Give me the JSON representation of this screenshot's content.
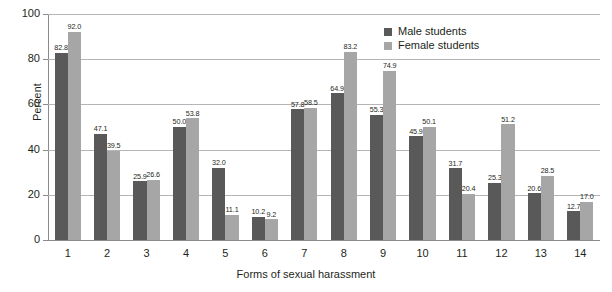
{
  "chart_data": {
    "type": "bar",
    "title": "",
    "subtitle": "",
    "xlabel": "Forms of sexual harassment",
    "ylabel": "Percent",
    "categories": [
      "1",
      "2",
      "3",
      "4",
      "5",
      "6",
      "7",
      "8",
      "9",
      "10",
      "11",
      "12",
      "13",
      "14"
    ],
    "ylim": [
      0,
      100
    ],
    "y_ticks": [
      0,
      20,
      40,
      60,
      80,
      100
    ],
    "grid": "horizontal",
    "legend_position": "top-right",
    "series": [
      {
        "name": "Male students",
        "color": "#595959",
        "values": [
          82.8,
          47.1,
          25.9,
          50.0,
          32.0,
          10.2,
          57.8,
          64.9,
          55.3,
          45.9,
          31.7,
          25.3,
          20.6,
          12.7
        ],
        "labels": [
          "82.8",
          "47.1",
          "25.9",
          "50.0",
          "32.0",
          "10.2",
          "57.8",
          "64.9",
          "55.3",
          "45.9",
          "31.7",
          "25.3",
          "20.6",
          "12.7"
        ]
      },
      {
        "name": "Female students",
        "color": "#a6a6a6",
        "values": [
          92.0,
          39.5,
          26.6,
          53.8,
          11.1,
          9.2,
          58.5,
          83.2,
          74.9,
          50.1,
          20.4,
          51.2,
          28.5,
          17.0
        ],
        "labels": [
          "92.0",
          "39.5",
          "26.6",
          "53.8",
          "11.1",
          "9.2",
          "58.5",
          "83.2",
          "74.9",
          "50.1",
          "20.4",
          "51.2",
          "28.5",
          "17.0"
        ]
      }
    ]
  },
  "axes": {
    "y_title": "Percent",
    "x_title": "Forms of sexual harassment",
    "y_tick_labels": [
      "100",
      "80",
      "60",
      "40",
      "20",
      "0"
    ],
    "x_tick_labels": [
      "1",
      "2",
      "3",
      "4",
      "5",
      "6",
      "7",
      "8",
      "9",
      "10",
      "11",
      "12",
      "13",
      "14"
    ]
  },
  "legend": {
    "items": [
      {
        "label": "Male students",
        "color": "#595959"
      },
      {
        "label": "Female students",
        "color": "#a6a6a6"
      }
    ]
  }
}
